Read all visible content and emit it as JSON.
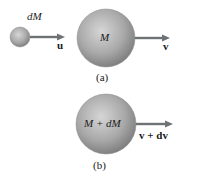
{
  "diagram": {
    "part_a": {
      "caption": "(a)",
      "small_mass": {
        "label": "dM",
        "velocity_label": "u"
      },
      "large_mass": {
        "label": "M",
        "velocity_label": "v"
      }
    },
    "part_b": {
      "caption": "(b)",
      "combined_mass": {
        "label": "M + dM",
        "velocity_label": "v + dv"
      }
    },
    "colors": {
      "sphere_light": "#d4d4d4",
      "sphere_mid": "#a8a8a8",
      "sphere_dark": "#7a7a7a",
      "arrow": "#6e7275"
    }
  }
}
